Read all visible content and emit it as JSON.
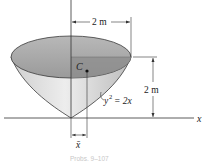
{
  "figure": {
    "axes": {
      "x_label": "x",
      "y_label": "y"
    },
    "dimensions": {
      "top_radius": "2 m",
      "height": "2 m",
      "centroid_offset_symbol": "x̄"
    },
    "centroid_label": "C",
    "curve_equation": {
      "lhs": "y",
      "exponent": "2",
      "rhs": "= 2x"
    },
    "caption": "Probs. 9–107"
  },
  "colors": {
    "outline": "#3a3a3a",
    "top_fill": "#a9a9a9",
    "top_shade": "#8f8f8f",
    "cone_fill_light": "#e6e6e6",
    "cone_fill_dark": "#b5b5b5",
    "line": "#333333"
  }
}
